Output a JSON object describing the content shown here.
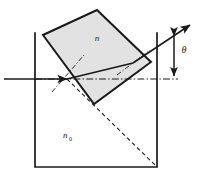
{
  "figure": {
    "type": "optics-ray-diagram",
    "width": 199,
    "height": 174
  },
  "labels": {
    "prism_index": "n",
    "medium_index_base": "n",
    "medium_index_sub": "0",
    "angle": "θ"
  },
  "colors": {
    "stroke": "#1a1a1a",
    "prism_fill": "#e2e2e2",
    "background": "#ffffff",
    "container_fill": "#ffffff"
  },
  "geometry": {
    "container": {
      "left_x": 35,
      "right_x": 157,
      "top_y": 33,
      "bottom_y": 167
    },
    "prism_vertices": [
      {
        "name": "top",
        "x": 97,
        "y": 10
      },
      {
        "name": "right",
        "x": 151,
        "y": 62
      },
      {
        "name": "bottom",
        "x": 94,
        "y": 104
      },
      {
        "name": "left",
        "x": 43,
        "y": 35
      }
    ],
    "entry_point": {
      "x": 67,
      "y": 79
    },
    "exit_point": {
      "x": 133,
      "y": 63
    },
    "axis_y": 79
  },
  "elements": {
    "incident_ray": "incident-ray",
    "internal_ray": "internal-refracted-ray",
    "exit_ray": "exit-ray",
    "optical_axis": "optical-axis-dash-dot",
    "normal_entry": "entry-normal-dash-dot",
    "normal_exit": "exit-normal-dash-dot",
    "virtual_ray": "virtual-dashed-ray",
    "angle_arrow": "theta-double-arrow"
  }
}
